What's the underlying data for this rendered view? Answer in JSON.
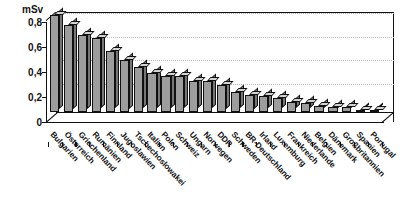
{
  "chart_data": {
    "type": "bar",
    "title": "",
    "subtitle": "",
    "xlabel": "",
    "ylabel": "mSv",
    "unit_label": "mSv",
    "ylim": [
      0,
      0.8
    ],
    "yticks": [
      0,
      0.2,
      0.4,
      0.6,
      0.8
    ],
    "ytick_labels": [
      "0",
      "0,2",
      "0,4",
      "0,6",
      "0,8"
    ],
    "grid": true,
    "grid_axis": "y",
    "legend": false,
    "legend_position": "none",
    "style": "3d-column",
    "bar_color": "#9d9d9d",
    "bar_edge_color": "#111111",
    "categories": [
      "Bulgarien",
      "Österreich",
      "Griechenland",
      "Rumänien",
      "Finnland",
      "Jugoslawien",
      "Tschechoslowakei",
      "Italien",
      "Polen",
      "Schweiz",
      "Ungarn",
      "Norwegen",
      "DDR",
      "Schweden",
      "BR-Deutschland",
      "Irland",
      "Luxemburg",
      "Frankreich",
      "Niederlande",
      "Belgien",
      "Dänemark",
      "Großbritannien",
      "Spanien",
      "Portugal"
    ],
    "values": [
      0.78,
      0.7,
      0.62,
      0.59,
      0.49,
      0.42,
      0.36,
      0.31,
      0.29,
      0.29,
      0.25,
      0.25,
      0.22,
      0.16,
      0.14,
      0.13,
      0.11,
      0.08,
      0.07,
      0.05,
      0.04,
      0.04,
      0.015,
      0.012
    ],
    "values_labels": [
      "0,78",
      "0,70",
      "0,62",
      "0,59",
      "0,49",
      "0,42",
      "0,36",
      "0,31",
      "0,29",
      "0,29",
      "0,25",
      "0,25",
      "0,22",
      "0,16",
      "0,14",
      "0,13",
      "0,11",
      "0,08",
      "0,07",
      "0,05",
      "0,04",
      "0,04",
      "0,015",
      "0,012"
    ]
  }
}
